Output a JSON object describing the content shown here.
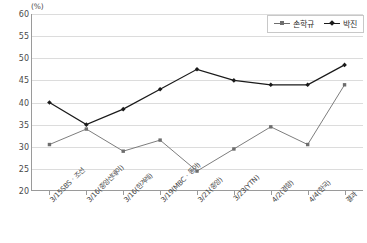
{
  "chart_data": {
    "type": "line",
    "title": "",
    "xlabel": "",
    "ylabel": "",
    "yunit": "(%)",
    "ylim": [
      20,
      60
    ],
    "yticks": [
      20,
      25,
      30,
      35,
      40,
      45,
      50,
      55,
      60
    ],
    "grid": true,
    "legend_position": "top-right",
    "categories": [
      "3/15SBS · 조선",
      "3/16(중앙선데이)",
      "3/16(한겨레)",
      "3/19(MBC · 동아)",
      "3/21(중앙)",
      "3/23(YTN)",
      "4/2(경향)",
      "4/4(한국)",
      "결과"
    ],
    "series": [
      {
        "name": "손학규",
        "color": "#6e6e6e",
        "marker": "square",
        "values": [
          30.5,
          34.0,
          29.0,
          31.5,
          24.5,
          29.5,
          34.5,
          30.5,
          44.0
        ]
      },
      {
        "name": "박진",
        "color": "#1a1a1a",
        "marker": "diamond",
        "values": [
          40.0,
          35.0,
          38.5,
          43.0,
          47.5,
          45.0,
          44.0,
          44.0,
          48.5
        ]
      }
    ]
  },
  "legend": {
    "items": [
      {
        "label": "손학규"
      },
      {
        "label": "박진"
      }
    ]
  },
  "colors": {
    "series_1": "#6e6e6e",
    "series_2": "#1a1a1a",
    "gridline": "#dcdcdc",
    "axis": "#9a9a9a",
    "text": "#3a3a3a"
  }
}
